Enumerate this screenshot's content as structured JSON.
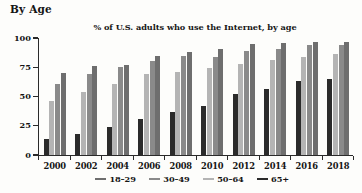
{
  "section": {
    "heading": "By Age"
  },
  "chart_data": {
    "type": "bar",
    "title": "% of U.S. adults who use the Internet, by age",
    "xlabel": "",
    "ylabel": "",
    "ylim": [
      0,
      100
    ],
    "yticks": [
      0,
      25,
      50,
      75,
      100
    ],
    "ytick_labels": [
      "0",
      "25",
      "50",
      "75",
      "100"
    ],
    "grid": false,
    "legend_position": "bottom",
    "categories": [
      "2000",
      "2002",
      "2004",
      "2006",
      "2008",
      "2010",
      "2012",
      "2014",
      "2016",
      "2018"
    ],
    "series": [
      {
        "name": "65+",
        "color": "#2b2b2b",
        "values": [
          14,
          18,
          24,
          31,
          37,
          42,
          52,
          56,
          63,
          65
        ]
      },
      {
        "name": "50-64",
        "color": "#b4b4b4",
        "values": [
          46,
          54,
          61,
          69,
          71,
          74,
          78,
          81,
          84,
          86
        ]
      },
      {
        "name": "30-49",
        "color": "#8a8a8a",
        "values": [
          61,
          69,
          75,
          80,
          85,
          84,
          89,
          91,
          94,
          94
        ]
      },
      {
        "name": "18-29",
        "color": "#6e6e6e",
        "values": [
          70,
          76,
          77,
          85,
          88,
          91,
          95,
          96,
          97,
          97
        ]
      }
    ]
  },
  "legend": {
    "items": [
      {
        "label": "18–29",
        "color": "#6e6e6e"
      },
      {
        "label": "30–49",
        "color": "#8a8a8a"
      },
      {
        "label": "50–64",
        "color": "#b4b4b4"
      },
      {
        "label": "65+",
        "color": "#2b2b2b"
      }
    ]
  }
}
